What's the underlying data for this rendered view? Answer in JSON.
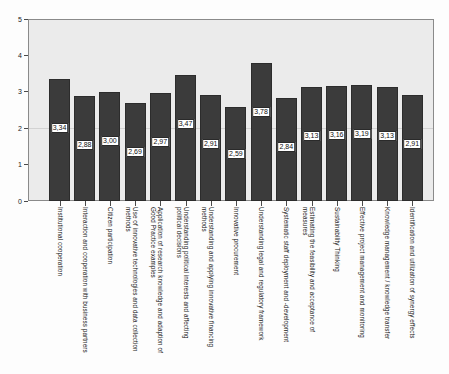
{
  "chart_data": {
    "type": "bar",
    "title": "",
    "xlabel": "",
    "ylabel": "",
    "ylim": [
      0,
      5
    ],
    "yticks": [
      "0",
      "1",
      "2",
      "3",
      "4",
      "5"
    ],
    "grid": true,
    "legend": "none",
    "decimal_separator": ",",
    "bar_color": "#3b3b3b",
    "plot_background": "#ebebeb",
    "categories": [
      "Institutional cooperation",
      "Interaction and cooperation with business partners",
      "Citizen participation",
      "Use of innovative technologies and data collection methods",
      "Application of research knowledge and adaption of Good Practice examples",
      "Understanding political interests and affecting political decisions",
      "Understanding and applying innovative financing methods",
      "Innovative procurement",
      "Understanding legal and regulatory framework",
      "Systematic staff deployment and -development",
      "Estimating the feasibility and acceptance of measures",
      "Sustainability Thinking",
      "Effective project management and monitoring",
      "Knowledge management / knowledge transfer",
      "Identification and utilization of synergy effects"
    ],
    "values": [
      3.34,
      2.88,
      3.0,
      2.69,
      2.97,
      3.47,
      2.91,
      2.59,
      3.78,
      2.84,
      3.13,
      3.16,
      3.19,
      3.13,
      2.91
    ],
    "value_labels": [
      "3,34",
      "2,88",
      "3,00",
      "2,69",
      "2,97",
      "3,47",
      "2,91",
      "2,59",
      "3,78",
      "2,84",
      "3,13",
      "3,16",
      "3,19",
      "3,13",
      "2,91"
    ]
  }
}
